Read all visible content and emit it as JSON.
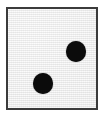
{
  "image": {
    "subject": "die-face",
    "title": "Die face showing two",
    "width": 105,
    "height": 116,
    "background_color": "#ffffff"
  },
  "die": {
    "name": "die",
    "pip_count": 2,
    "value_label": "2",
    "face_color": "#ededed",
    "border_color": "#3b3b3b",
    "border_width": 2,
    "pip_color": "#0b0b0b",
    "pips": [
      {
        "name": "pip-top-right",
        "position": "upper-right",
        "x": 68,
        "y": 43,
        "diameter": 20
      },
      {
        "name": "pip-bottom-left",
        "position": "lower-left",
        "x": 35,
        "y": 75,
        "diameter": 20
      }
    ]
  }
}
